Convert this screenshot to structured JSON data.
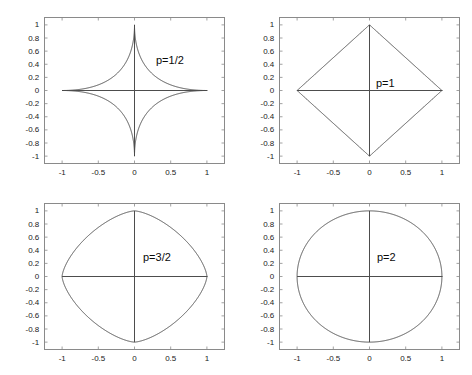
{
  "figure": {
    "background_color": "#ffffff",
    "axis_color": "#8a8a8a",
    "curve_color": "#4d4d4d",
    "text_color": "#1a1a1a",
    "width": 472,
    "height": 375
  },
  "chart_data": [
    {
      "type": "line",
      "title": "",
      "annotation": "p=1/2",
      "xlabel": "",
      "ylabel": "",
      "xlim": [
        -1.25,
        1.25
      ],
      "ylim": [
        -1.12,
        1.12
      ],
      "xticks": [
        -1,
        -0.5,
        0,
        0.5,
        1
      ],
      "xtick_labels": [
        "-1",
        "-0.5",
        "0",
        "0.5",
        "1"
      ],
      "yticks": [
        1,
        0.8,
        0.6,
        0.4,
        0.2,
        0,
        -0.2,
        -0.4,
        -0.6,
        -0.8,
        -1
      ],
      "ytick_labels": [
        "1",
        "0.8",
        "0.6",
        "0.4",
        "0.2",
        "0",
        "-0.2",
        "-0.4",
        "-0.6",
        "-0.8",
        "-1"
      ],
      "grid": false,
      "legend": "none",
      "curve": "superellipse",
      "p": 0.5,
      "description": "Unit ball of the p-norm for p=1/2: astroid-like concave star through (1,0), (0,1), (-1,0), (0,-1)",
      "vertices": [
        [
          1,
          0
        ],
        [
          0,
          1
        ],
        [
          -1,
          0
        ],
        [
          0,
          -1
        ]
      ],
      "crosshair_x": [
        -1,
        1
      ],
      "crosshair_y": [
        -1,
        1
      ]
    },
    {
      "type": "line",
      "title": "",
      "annotation": "p=1",
      "xlabel": "",
      "ylabel": "",
      "xlim": [
        -1.25,
        1.25
      ],
      "ylim": [
        -1.12,
        1.12
      ],
      "xticks": [
        -1,
        -0.5,
        0,
        0.5,
        1
      ],
      "xtick_labels": [
        "-1",
        "-0.5",
        "0",
        "0.5",
        "1"
      ],
      "yticks": [
        1,
        0.8,
        0.6,
        0.4,
        0.2,
        0,
        -0.2,
        -0.4,
        -0.6,
        -0.8,
        -1
      ],
      "ytick_labels": [
        "1",
        "0.8",
        "0.6",
        "0.4",
        "0.2",
        "0",
        "-0.2",
        "-0.4",
        "-0.6",
        "-0.8",
        "-1"
      ],
      "grid": false,
      "legend": "none",
      "curve": "superellipse",
      "p": 1,
      "description": "Unit ball of the p-norm for p=1: diamond (square rotated 45 degrees) with vertices at (1,0), (0,1), (-1,0), (0,-1)",
      "vertices": [
        [
          1,
          0
        ],
        [
          0,
          1
        ],
        [
          -1,
          0
        ],
        [
          0,
          -1
        ]
      ],
      "crosshair_x": [
        -1,
        1
      ],
      "crosshair_y": [
        -1,
        1
      ]
    },
    {
      "type": "line",
      "title": "",
      "annotation": "p=3/2",
      "xlabel": "",
      "ylabel": "",
      "xlim": [
        -1.25,
        1.25
      ],
      "ylim": [
        -1.12,
        1.12
      ],
      "xticks": [
        -1,
        -0.5,
        0,
        0.5,
        1
      ],
      "xtick_labels": [
        "-1",
        "-0.5",
        "0",
        "0.5",
        "1"
      ],
      "yticks": [
        1,
        0.8,
        0.6,
        0.4,
        0.2,
        0,
        -0.2,
        -0.4,
        -0.6,
        -0.8,
        -1
      ],
      "ytick_labels": [
        "1",
        "0.8",
        "0.6",
        "0.4",
        "0.2",
        "0",
        "-0.2",
        "-0.4",
        "-0.6",
        "-0.8",
        "-1"
      ],
      "grid": false,
      "legend": "none",
      "curve": "superellipse",
      "p": 1.5,
      "description": "Unit ball of the p-norm for p=3/2: convex rounded shape with slight corners at (1,0), (0,1), (-1,0), (0,-1)",
      "vertices": [
        [
          1,
          0
        ],
        [
          0,
          1
        ],
        [
          -1,
          0
        ],
        [
          0,
          -1
        ]
      ],
      "crosshair_x": [
        -1,
        1
      ],
      "crosshair_y": [
        -1,
        1
      ]
    },
    {
      "type": "line",
      "title": "",
      "annotation": "p=2",
      "xlabel": "",
      "ylabel": "",
      "xlim": [
        -1.25,
        1.25
      ],
      "ylim": [
        -1.12,
        1.12
      ],
      "xticks": [
        -1,
        -0.5,
        0,
        0.5,
        1
      ],
      "xtick_labels": [
        "-1",
        "-0.5",
        "0",
        "0.5",
        "1"
      ],
      "yticks": [
        1,
        0.8,
        0.6,
        0.4,
        0.2,
        0,
        -0.2,
        -0.4,
        -0.6,
        -0.8,
        -1
      ],
      "ytick_labels": [
        "1",
        "0.8",
        "0.6",
        "0.4",
        "0.2",
        "0",
        "-0.2",
        "-0.4",
        "-0.6",
        "-0.8",
        "-1"
      ],
      "grid": false,
      "legend": "none",
      "curve": "superellipse",
      "p": 2,
      "description": "Unit ball of the p-norm for p=2: the unit circle through (1,0), (0,1), (-1,0), (0,-1)",
      "vertices": [
        [
          1,
          0
        ],
        [
          0,
          1
        ],
        [
          -1,
          0
        ],
        [
          0,
          -1
        ]
      ],
      "crosshair_x": [
        -1,
        1
      ],
      "crosshair_y": [
        -1,
        1
      ]
    }
  ],
  "panels": [
    {
      "id": "panel-p-half",
      "annotation": "p=1/2",
      "box": {
        "left": 44,
        "top": 17,
        "width": 181,
        "height": 147
      },
      "annotation_pos": {
        "left": 156,
        "top": 54
      }
    },
    {
      "id": "panel-p-one",
      "annotation": "p=1",
      "box": {
        "left": 279,
        "top": 17,
        "width": 181,
        "height": 147
      },
      "annotation_pos": {
        "left": 376,
        "top": 77
      }
    },
    {
      "id": "panel-p-three-half",
      "annotation": "p=3/2",
      "box": {
        "left": 44,
        "top": 203,
        "width": 181,
        "height": 147
      },
      "annotation_pos": {
        "left": 143,
        "top": 251
      }
    },
    {
      "id": "panel-p-two",
      "annotation": "p=2",
      "box": {
        "left": 279,
        "top": 203,
        "width": 181,
        "height": 147
      },
      "annotation_pos": {
        "left": 377,
        "top": 251
      }
    }
  ]
}
